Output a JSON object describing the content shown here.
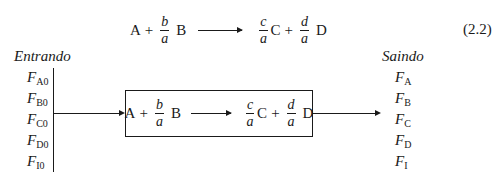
{
  "equation": {
    "reactant1": "A",
    "plus": "+",
    "coef_b": {
      "num": "b",
      "den": "a"
    },
    "reactant2": "B",
    "coef_c": {
      "num": "c",
      "den": "a"
    },
    "product1": "C",
    "coef_d": {
      "num": "d",
      "den": "a"
    },
    "product2": "D",
    "number": "(2.2)"
  },
  "diagram": {
    "inlet_heading": "Entrando",
    "outlet_heading": "Saindo",
    "inlet_streams": [
      {
        "symbol": "F",
        "sub": "A0"
      },
      {
        "symbol": "F",
        "sub": "B0"
      },
      {
        "symbol": "F",
        "sub": "C0"
      },
      {
        "symbol": "F",
        "sub": "D0"
      },
      {
        "symbol": "F",
        "sub": "I0"
      }
    ],
    "outlet_streams": [
      {
        "symbol": "F",
        "sub": "A"
      },
      {
        "symbol": "F",
        "sub": "B"
      },
      {
        "symbol": "F",
        "sub": "C"
      },
      {
        "symbol": "F",
        "sub": "D"
      },
      {
        "symbol": "F",
        "sub": "I"
      }
    ]
  }
}
